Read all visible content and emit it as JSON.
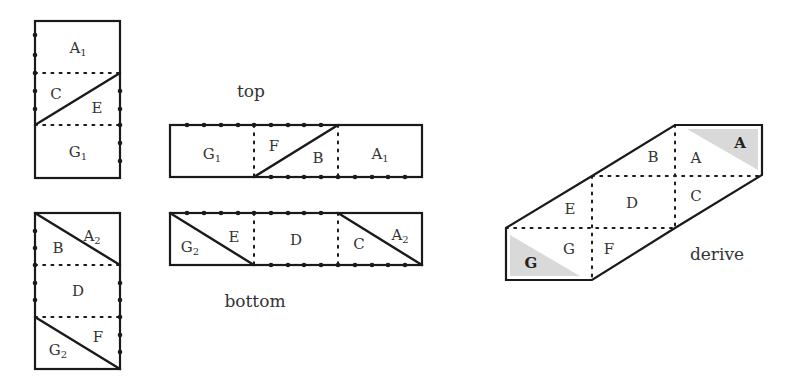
{
  "captions": {
    "top": "top",
    "bottom": "bottom",
    "derive": "derive"
  },
  "colors": {
    "line": "#1a1a1a",
    "shade": "#d9d9d9",
    "text": "#333333"
  },
  "panels": {
    "left_top": {
      "rect": [
        35,
        21,
        85,
        157
      ],
      "folds": [
        [
          35,
          73,
          120,
          73
        ],
        [
          35,
          125,
          120,
          125
        ]
      ],
      "cuts": [
        [
          35,
          125,
          120,
          73
        ]
      ],
      "dots_left": {
        "x": 35,
        "ys": [
          35,
          55,
          73,
          91,
          109
        ]
      },
      "dots_right": {
        "x": 120,
        "ys": [
          91,
          109,
          125,
          143,
          161
        ]
      },
      "labels": [
        {
          "text": "A",
          "sub": "1",
          "x": 78,
          "y": 48
        },
        {
          "text": "C",
          "sub": "",
          "x": 56,
          "y": 94
        },
        {
          "text": "E",
          "sub": "",
          "x": 97,
          "y": 108
        },
        {
          "text": "G",
          "sub": "1",
          "x": 78,
          "y": 152
        }
      ]
    },
    "left_bottom": {
      "rect": [
        35,
        213,
        85,
        156
      ],
      "folds": [
        [
          35,
          265,
          120,
          265
        ],
        [
          35,
          317,
          120,
          317
        ]
      ],
      "cuts": [
        [
          35,
          213,
          120,
          265
        ],
        [
          35,
          317,
          120,
          369
        ]
      ],
      "dots_left": {
        "x": 35,
        "ys": [
          231,
          248,
          265,
          283,
          300
        ]
      },
      "dots_right": {
        "x": 120,
        "ys": [
          283,
          300,
          317,
          335,
          352
        ]
      },
      "labels": [
        {
          "text": "A",
          "sub": "2",
          "x": 92,
          "y": 236
        },
        {
          "text": "B",
          "sub": "",
          "x": 58,
          "y": 248
        },
        {
          "text": "D",
          "sub": "",
          "x": 78,
          "y": 291
        },
        {
          "text": "F",
          "sub": "",
          "x": 98,
          "y": 337
        },
        {
          "text": "G",
          "sub": "2",
          "x": 58,
          "y": 350
        }
      ]
    },
    "top_strip": {
      "rect": [
        170,
        125,
        252,
        52
      ],
      "folds": [
        [
          254,
          125,
          254,
          177
        ],
        [
          338,
          125,
          338,
          177
        ]
      ],
      "cuts": [
        [
          254,
          177,
          338,
          125
        ]
      ],
      "dots_top": {
        "y": 125,
        "xs": [
          187,
          204,
          221,
          238,
          254,
          271,
          288,
          304,
          321
        ]
      },
      "dots_bottom": {
        "y": 177,
        "xs": [
          271,
          288,
          304,
          321,
          338,
          355,
          372,
          388,
          405
        ]
      },
      "labels": [
        {
          "text": "G",
          "sub": "1",
          "x": 212,
          "y": 154
        },
        {
          "text": "F",
          "sub": "",
          "x": 274,
          "y": 146
        },
        {
          "text": "B",
          "sub": "",
          "x": 318,
          "y": 158
        },
        {
          "text": "A",
          "sub": "1",
          "x": 380,
          "y": 154
        }
      ]
    },
    "bottom_strip": {
      "rect": [
        170,
        213,
        252,
        52
      ],
      "folds": [
        [
          254,
          213,
          254,
          265
        ],
        [
          338,
          213,
          338,
          265
        ]
      ],
      "cuts": [
        [
          170,
          213,
          254,
          265
        ],
        [
          338,
          213,
          422,
          265
        ]
      ],
      "dots_top": {
        "y": 213,
        "xs": [
          187,
          204,
          221,
          238,
          254,
          271,
          288,
          304,
          321
        ]
      },
      "dots_bottom": {
        "y": 265,
        "xs": [
          271,
          288,
          304,
          321,
          338,
          355,
          372,
          388,
          405
        ]
      },
      "labels": [
        {
          "text": "G",
          "sub": "2",
          "x": 190,
          "y": 247
        },
        {
          "text": "E",
          "sub": "",
          "x": 234,
          "y": 237
        },
        {
          "text": "D",
          "sub": "",
          "x": 296,
          "y": 240
        },
        {
          "text": "C",
          "sub": "",
          "x": 359,
          "y": 244
        },
        {
          "text": "A",
          "sub": "2",
          "x": 400,
          "y": 235
        }
      ]
    },
    "derive": {
      "outline": [
        [
          506,
          228
        ],
        [
          592,
          176
        ],
        [
          675,
          125
        ],
        [
          762,
          125
        ],
        [
          762,
          175
        ],
        [
          675,
          228
        ],
        [
          592,
          280
        ],
        [
          506,
          280
        ]
      ],
      "shades": [
        [
          [
            687,
            129
          ],
          [
            758,
            129
          ],
          [
            758,
            170
          ]
        ],
        [
          [
            510,
            235
          ],
          [
            510,
            276
          ],
          [
            580,
            276
          ]
        ]
      ],
      "folds": [
        [
          592,
          176,
          762,
          176
        ],
        [
          506,
          228,
          675,
          228
        ],
        [
          592,
          176,
          592,
          280
        ],
        [
          675,
          125,
          675,
          228
        ]
      ],
      "labels": [
        {
          "text": "B",
          "bold": false,
          "x": 653,
          "y": 157
        },
        {
          "text": "A",
          "bold": false,
          "x": 696,
          "y": 158
        },
        {
          "text": "A",
          "bold": true,
          "x": 740,
          "y": 143
        },
        {
          "text": "D",
          "bold": false,
          "x": 632,
          "y": 203
        },
        {
          "text": "C",
          "bold": false,
          "x": 696,
          "y": 196
        },
        {
          "text": "E",
          "bold": false,
          "x": 570,
          "y": 209
        },
        {
          "text": "G",
          "bold": false,
          "x": 569,
          "y": 249
        },
        {
          "text": "F",
          "bold": false,
          "x": 609,
          "y": 249
        },
        {
          "text": "G",
          "bold": true,
          "x": 531,
          "y": 263
        }
      ]
    }
  },
  "caption_positions": {
    "top": {
      "x": 251,
      "y": 91
    },
    "bottom": {
      "x": 255,
      "y": 301
    },
    "derive": {
      "x": 717,
      "y": 254
    }
  }
}
